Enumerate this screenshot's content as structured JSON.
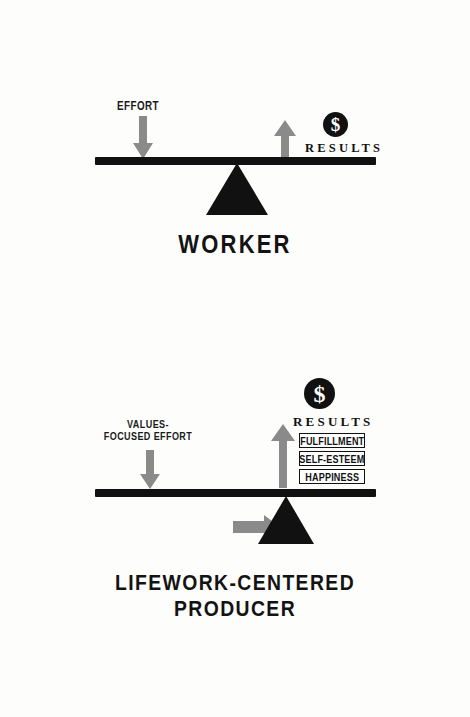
{
  "page": {
    "background_color": "#fdfdfc",
    "ink_color": "#111111",
    "accent_gray": "#8a8a8a"
  },
  "diagrams": [
    {
      "id": "worker",
      "title": "WORKER",
      "input": {
        "label": "EFFORT",
        "icon": "down-arrow-icon",
        "direction": "down",
        "color": "#8a8a8a"
      },
      "output": {
        "label": "RESULTS",
        "icon": "up-arrow-icon",
        "direction": "up",
        "color": "#8a8a8a",
        "badge": "$"
      },
      "fulcrum": {
        "icon": "triangle-fulcrum-icon",
        "position": "center"
      },
      "benefits": []
    },
    {
      "id": "lifework-centered-producer",
      "title_lines": [
        "LIFEWORK-CENTERED",
        "PRODUCER"
      ],
      "input": {
        "label_lines": [
          "VALUES-",
          "FOCUSED EFFORT"
        ],
        "icon": "down-arrow-icon",
        "direction": "down",
        "color": "#8a8a8a"
      },
      "output": {
        "label": "RESULTS",
        "icon": "up-arrow-icon",
        "direction": "up",
        "color": "#8a8a8a",
        "badge": "$"
      },
      "fulcrum": {
        "icon": "triangle-fulcrum-icon",
        "position": "right",
        "shift_icon": "right-arrow-icon",
        "shift_color": "#8a8a8a"
      },
      "benefits": [
        "FULFILLMENT",
        "SELF-ESTEEM",
        "HAPPINESS"
      ]
    }
  ]
}
